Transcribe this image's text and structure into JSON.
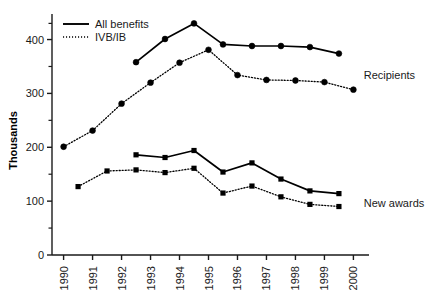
{
  "chart_data": {
    "type": "line",
    "title": "",
    "xlabel": "",
    "ylabel": "Thousands",
    "ylim": [
      0,
      440
    ],
    "xlim": [
      1989.6,
      2000.4
    ],
    "grid": false,
    "legend_position": "top-left",
    "ytick_labels": [
      "0",
      "100",
      "200",
      "300",
      "400"
    ],
    "ytick_values": [
      0,
      100,
      200,
      300,
      400
    ],
    "yminor_values": [
      50,
      150,
      250,
      350,
      430
    ],
    "categories": [
      "1990",
      "1991",
      "1992",
      "1993",
      "1994",
      "1995",
      "1996",
      "1997",
      "1998",
      "1999",
      "2000"
    ],
    "annotations": [
      {
        "text": "Recipients",
        "x": 2000.15,
        "y": 335
      },
      {
        "text": "New awards",
        "x": 2000.15,
        "y": 97
      }
    ],
    "legend": [
      {
        "label": "All benefits",
        "style": "solid"
      },
      {
        "label": "IVB/IB",
        "style": "dotted"
      }
    ],
    "series": [
      {
        "name": "Recipients - All benefits",
        "group": "Recipients",
        "benefit": "All benefits",
        "style": "solid",
        "marker": "circle",
        "x": [
          1992.5,
          1993.5,
          1994.5,
          1995.5,
          1996.5,
          1997.5,
          1998.5,
          1999.5
        ],
        "values": [
          358,
          401,
          430,
          391,
          388,
          388,
          386,
          374
        ]
      },
      {
        "name": "Recipients - IVB/IB",
        "group": "Recipients",
        "benefit": "IVB/IB",
        "style": "dotted",
        "marker": "circle",
        "x": [
          1990,
          1991,
          1992,
          1993,
          1994,
          1995,
          1996,
          1997,
          1998,
          1999,
          2000
        ],
        "values": [
          201,
          231,
          281,
          320,
          357,
          381,
          334,
          325,
          324,
          321,
          307
        ]
      },
      {
        "name": "New awards - All benefits",
        "group": "New awards",
        "benefit": "All benefits",
        "style": "solid",
        "marker": "square",
        "x": [
          1992.5,
          1993.5,
          1994.5,
          1995.5,
          1996.5,
          1997.5,
          1998.5,
          1999.5
        ],
        "values": [
          186,
          181,
          194,
          154,
          171,
          141,
          119,
          114
        ]
      },
      {
        "name": "New awards - IVB/IB",
        "group": "New awards",
        "benefit": "IVB/IB",
        "style": "dotted",
        "marker": "square",
        "x": [
          1990.5,
          1991.5,
          1992.5,
          1993.5,
          1994.5,
          1995.5,
          1996.5,
          1997.5,
          1998.5,
          1999.5
        ],
        "values": [
          127,
          156,
          158,
          153,
          161,
          115,
          128,
          108,
          94,
          90
        ]
      }
    ]
  },
  "colors": {
    "line": "#000000",
    "axis": "#1a1a1a",
    "text": "#1a1a1a",
    "background": "#ffffff"
  }
}
